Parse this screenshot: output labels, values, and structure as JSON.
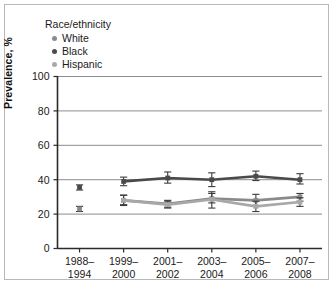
{
  "legend": {
    "title": "Race/ethnicity",
    "items": [
      {
        "label": "White",
        "color": "#8a8a8a",
        "marker": "legend-dot-white"
      },
      {
        "label": "Black",
        "color": "#4a4a4a",
        "marker": "legend-dot-black"
      },
      {
        "label": "Hispanic",
        "color": "#a8a8a8",
        "marker": "legend-dot-hispanic"
      }
    ]
  },
  "axes": {
    "ylabel": "Prevalence, %",
    "yticks": [
      "0",
      "20",
      "40",
      "60",
      "80",
      "100"
    ],
    "xticks": [
      {
        "line1": "1988–",
        "line2": "1994"
      },
      {
        "line1": "1999–",
        "line2": "2000"
      },
      {
        "line1": "2001–",
        "line2": "2002"
      },
      {
        "line1": "2003–",
        "line2": "2004"
      },
      {
        "line1": "2005–",
        "line2": "2006"
      },
      {
        "line1": "2007–",
        "line2": "2008"
      }
    ]
  },
  "chart_data": {
    "type": "line",
    "title": "",
    "xlabel": "",
    "ylabel": "Prevalence, %",
    "ylim": [
      0,
      100
    ],
    "yticks": [
      0,
      20,
      40,
      60,
      80,
      100
    ],
    "grid": "horizontal",
    "legend_position": "above-left",
    "categories": [
      "1988–1994",
      "1999–2000",
      "2001–2002",
      "2003–2004",
      "2005–2006",
      "2007–2008"
    ],
    "series": [
      {
        "name": "White",
        "color": "#8a8a8a",
        "values": [
          23.0,
          28.0,
          26.0,
          29.0,
          28.0,
          30.0
        ],
        "error_low": [
          21.5,
          25.5,
          24.0,
          26.5,
          25.0,
          27.5
        ],
        "error_high": [
          24.5,
          31.0,
          28.0,
          32.0,
          31.5,
          32.0
        ],
        "connected_from_index": 1
      },
      {
        "name": "Black",
        "color": "#4a4a4a",
        "values": [
          35.5,
          39.0,
          41.0,
          40.0,
          42.0,
          40.0
        ],
        "error_low": [
          34.0,
          36.5,
          38.0,
          36.0,
          39.5,
          37.5
        ],
        "error_high": [
          37.0,
          41.5,
          44.5,
          44.0,
          45.0,
          43.5
        ],
        "connected_from_index": 1
      },
      {
        "name": "Hispanic",
        "color": "#a8a8a8",
        "values": [
          null,
          28.0,
          25.5,
          28.5,
          24.5,
          27.0
        ],
        "error_low": [
          null,
          25.0,
          23.5,
          23.5,
          21.5,
          24.5
        ],
        "error_high": [
          null,
          31.0,
          27.5,
          33.0,
          27.5,
          29.5
        ],
        "connected_from_index": 1
      }
    ]
  }
}
